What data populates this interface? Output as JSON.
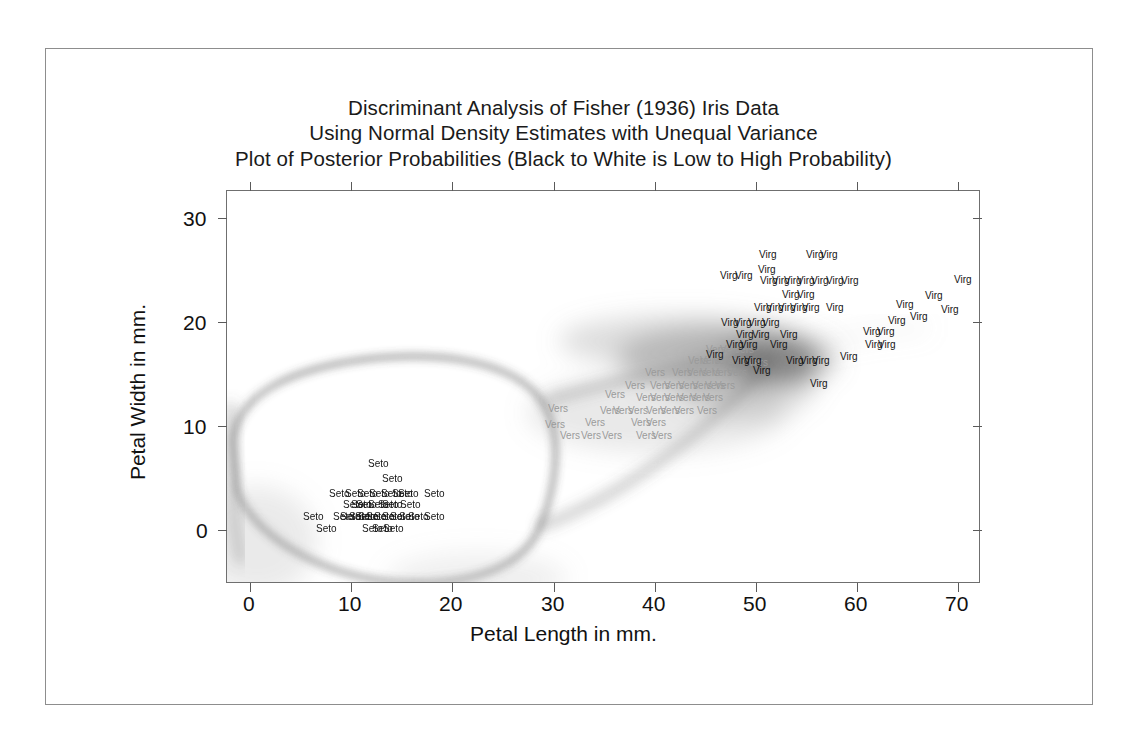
{
  "figure": {
    "title_lines": [
      "Discriminant Analysis of Fisher (1936) Iris Data",
      "Using Normal Density Estimates with Unequal Variance",
      "Plot of Posterior Probabilities (Black to White is Low to High Probability)"
    ],
    "background_color": "#ffffff",
    "frame_color": "#8d8d8d",
    "axis_color": "#6f6f6f"
  },
  "chart_data": {
    "type": "scatter",
    "xlabel": "Petal Length in mm.",
    "ylabel": "Petal Width in mm.",
    "xlim": [
      -4,
      74
    ],
    "ylim": [
      -5,
      33
    ],
    "xticks": [
      0,
      10,
      20,
      30,
      40,
      50,
      60,
      70
    ],
    "yticks": [
      0,
      10,
      20,
      30
    ],
    "xtick_labels": [
      "0",
      "10",
      "20",
      "30",
      "40",
      "50",
      "60",
      "70"
    ],
    "ytick_labels": [
      "0",
      "10",
      "20",
      "30"
    ],
    "grid": false,
    "legend": "none",
    "annotation": "Shaded background encodes posterior probability: black = low, white = high.",
    "group_labels": {
      "setosa": "Seto",
      "versicolor": "Vers",
      "virginica": "Virg"
    },
    "group_colors": {
      "setosa": "#141414",
      "versicolor": "#9a9a9a",
      "virginica": "#141414"
    },
    "series": [
      {
        "name": "Seto",
        "species": "Iris setosa",
        "color": "#141414",
        "points": [
          [
            14,
            2
          ],
          [
            15,
            1
          ],
          [
            13,
            2
          ],
          [
            15,
            2
          ],
          [
            14,
            2
          ],
          [
            17,
            4
          ],
          [
            14,
            3
          ],
          [
            15,
            2
          ],
          [
            14,
            2
          ],
          [
            15,
            1
          ],
          [
            15,
            2
          ],
          [
            16,
            2
          ],
          [
            14,
            1
          ],
          [
            11,
            1
          ],
          [
            12,
            2
          ],
          [
            15,
            4
          ],
          [
            13,
            4
          ],
          [
            14,
            3
          ],
          [
            17,
            3
          ],
          [
            15,
            3
          ],
          [
            17,
            2
          ],
          [
            15,
            4
          ],
          [
            10,
            2
          ],
          [
            17,
            5
          ],
          [
            19,
            2
          ],
          [
            16,
            2
          ],
          [
            16,
            4
          ],
          [
            15,
            2
          ],
          [
            14,
            2
          ],
          [
            16,
            2
          ],
          [
            16,
            2
          ],
          [
            15,
            4
          ],
          [
            15,
            1
          ],
          [
            14,
            2
          ],
          [
            15,
            2
          ],
          [
            12,
            2
          ],
          [
            13,
            2
          ],
          [
            15,
            1
          ],
          [
            13,
            2
          ],
          [
            15,
            2
          ],
          [
            13,
            3
          ],
          [
            13,
            3
          ],
          [
            13,
            2
          ],
          [
            16,
            6
          ],
          [
            19,
            4
          ],
          [
            14,
            3
          ],
          [
            16,
            2
          ],
          [
            14,
            2
          ],
          [
            15,
            2
          ],
          [
            14,
            2
          ]
        ]
      },
      {
        "name": "Vers",
        "species": "Iris versicolor",
        "color": "#9a9a9a",
        "points": [
          [
            47,
            14
          ],
          [
            45,
            15
          ],
          [
            49,
            15
          ],
          [
            40,
            13
          ],
          [
            46,
            15
          ],
          [
            45,
            13
          ],
          [
            47,
            16
          ],
          [
            33,
            10
          ],
          [
            46,
            13
          ],
          [
            39,
            14
          ],
          [
            35,
            10
          ],
          [
            42,
            15
          ],
          [
            40,
            10
          ],
          [
            47,
            14
          ],
          [
            36,
            13
          ],
          [
            44,
            14
          ],
          [
            45,
            15
          ],
          [
            41,
            10
          ],
          [
            45,
            15
          ],
          [
            39,
            11
          ],
          [
            48,
            18
          ],
          [
            40,
            13
          ],
          [
            49,
            15
          ],
          [
            47,
            12
          ],
          [
            43,
            13
          ],
          [
            44,
            14
          ],
          [
            48,
            14
          ],
          [
            50,
            17
          ],
          [
            45,
            15
          ],
          [
            35,
            10
          ],
          [
            38,
            11
          ],
          [
            37,
            10
          ],
          [
            39,
            12
          ],
          [
            51,
            16
          ],
          [
            45,
            15
          ],
          [
            45,
            16
          ],
          [
            47,
            15
          ],
          [
            44,
            13
          ],
          [
            41,
            13
          ],
          [
            40,
            13
          ],
          [
            44,
            12
          ],
          [
            46,
            14
          ],
          [
            40,
            12
          ],
          [
            33,
            10
          ],
          [
            42,
            13
          ],
          [
            42,
            12
          ],
          [
            42,
            13
          ],
          [
            43,
            13
          ],
          [
            30,
            11
          ],
          [
            41,
            13
          ]
        ]
      },
      {
        "name": "Virg",
        "species": "Iris virginica",
        "color": "#141414",
        "points": [
          [
            60,
            25
          ],
          [
            51,
            19
          ],
          [
            59,
            21
          ],
          [
            56,
            18
          ],
          [
            58,
            22
          ],
          [
            66,
            21
          ],
          [
            45,
            17
          ],
          [
            63,
            18
          ],
          [
            58,
            18
          ],
          [
            61,
            25
          ],
          [
            51,
            20
          ],
          [
            53,
            19
          ],
          [
            55,
            21
          ],
          [
            50,
            20
          ],
          [
            51,
            24
          ],
          [
            53,
            23
          ],
          [
            55,
            18
          ],
          [
            67,
            22
          ],
          [
            69,
            23
          ],
          [
            50,
            15
          ],
          [
            57,
            23
          ],
          [
            49,
            20
          ],
          [
            67,
            20
          ],
          [
            49,
            18
          ],
          [
            57,
            21
          ],
          [
            60,
            18
          ],
          [
            48,
            18
          ],
          [
            49,
            18
          ],
          [
            56,
            21
          ],
          [
            58,
            16
          ],
          [
            61,
            19
          ],
          [
            64,
            20
          ],
          [
            56,
            22
          ],
          [
            51,
            15
          ],
          [
            56,
            14
          ],
          [
            61,
            23
          ],
          [
            56,
            24
          ],
          [
            55,
            18
          ],
          [
            48,
            18
          ],
          [
            54,
            21
          ],
          [
            56,
            24
          ],
          [
            51,
            23
          ],
          [
            51,
            19
          ],
          [
            59,
            23
          ],
          [
            57,
            25
          ],
          [
            52,
            23
          ],
          [
            50,
            19
          ],
          [
            52,
            20
          ],
          [
            54,
            23
          ],
          [
            51,
            18
          ]
        ]
      }
    ]
  },
  "axes": {
    "x_title": "Petal Length in mm.",
    "y_title": "Petal Width in mm."
  },
  "labels": {
    "seto": [
      {
        "t": "Seto",
        "x": 368,
        "y": 459
      },
      {
        "t": "Seto",
        "x": 382,
        "y": 474
      },
      {
        "t": "Seto",
        "x": 329,
        "y": 489
      },
      {
        "t": "Seto",
        "x": 357,
        "y": 489
      },
      {
        "t": "Seto",
        "x": 369,
        "y": 489
      },
      {
        "t": "Seto",
        "x": 381,
        "y": 489
      },
      {
        "t": "Seto",
        "x": 398,
        "y": 489
      },
      {
        "t": "Seto",
        "x": 424,
        "y": 489
      },
      {
        "t": "Seto",
        "x": 343,
        "y": 500
      },
      {
        "t": "Seto",
        "x": 356,
        "y": 500
      },
      {
        "t": "Seto",
        "x": 368,
        "y": 500
      },
      {
        "t": "Seto",
        "x": 382,
        "y": 500
      },
      {
        "t": "Seto",
        "x": 400,
        "y": 500
      },
      {
        "t": "Seto",
        "x": 303,
        "y": 512
      },
      {
        "t": "Seto",
        "x": 333,
        "y": 512
      },
      {
        "t": "Seto",
        "x": 349,
        "y": 512
      },
      {
        "t": "Seto",
        "x": 358,
        "y": 512
      },
      {
        "t": "Seto",
        "x": 366,
        "y": 512
      },
      {
        "t": "Seto",
        "x": 374,
        "y": 512
      },
      {
        "t": "Seto",
        "x": 382,
        "y": 512
      },
      {
        "t": "Seto",
        "x": 390,
        "y": 512
      },
      {
        "t": "Seto",
        "x": 399,
        "y": 512
      },
      {
        "t": "Seto",
        "x": 424,
        "y": 512
      },
      {
        "t": "Seto",
        "x": 316,
        "y": 524
      },
      {
        "t": "Seto",
        "x": 362,
        "y": 524
      },
      {
        "t": "Seto",
        "x": 372,
        "y": 524
      },
      {
        "t": "Seto",
        "x": 383,
        "y": 524
      },
      {
        "t": "Seto",
        "x": 345,
        "y": 489
      },
      {
        "t": "Seto",
        "x": 351,
        "y": 500
      },
      {
        "t": "Seto",
        "x": 340,
        "y": 512
      },
      {
        "t": "Seto",
        "x": 355,
        "y": 512
      },
      {
        "t": "Seto",
        "x": 378,
        "y": 500
      },
      {
        "t": "Seto",
        "x": 392,
        "y": 489
      },
      {
        "t": "Seto",
        "x": 408,
        "y": 512
      }
    ],
    "vers": [
      {
        "t": "Vers",
        "x": 605,
        "y": 390
      },
      {
        "t": "Vers",
        "x": 548,
        "y": 404
      },
      {
        "t": "Vers",
        "x": 625,
        "y": 381
      },
      {
        "t": "Vers",
        "x": 650,
        "y": 381
      },
      {
        "t": "Vers",
        "x": 664,
        "y": 381
      },
      {
        "t": "Vers",
        "x": 678,
        "y": 381
      },
      {
        "t": "Vers",
        "x": 692,
        "y": 381
      },
      {
        "t": "Vers",
        "x": 705,
        "y": 381
      },
      {
        "t": "Vers",
        "x": 715,
        "y": 381
      },
      {
        "t": "Vers",
        "x": 645,
        "y": 368
      },
      {
        "t": "Vers",
        "x": 672,
        "y": 368
      },
      {
        "t": "Vers",
        "x": 687,
        "y": 368
      },
      {
        "t": "Vers",
        "x": 700,
        "y": 368
      },
      {
        "t": "Vers",
        "x": 712,
        "y": 368
      },
      {
        "t": "Vers",
        "x": 727,
        "y": 368
      },
      {
        "t": "Vers",
        "x": 688,
        "y": 356
      },
      {
        "t": "Vers",
        "x": 700,
        "y": 356
      },
      {
        "t": "Vers",
        "x": 713,
        "y": 356
      },
      {
        "t": "Vers",
        "x": 726,
        "y": 356
      },
      {
        "t": "Vers",
        "x": 739,
        "y": 356
      },
      {
        "t": "Vers",
        "x": 636,
        "y": 393
      },
      {
        "t": "Vers",
        "x": 650,
        "y": 393
      },
      {
        "t": "Vers",
        "x": 664,
        "y": 393
      },
      {
        "t": "Vers",
        "x": 677,
        "y": 393
      },
      {
        "t": "Vers",
        "x": 690,
        "y": 393
      },
      {
        "t": "Vers",
        "x": 703,
        "y": 393
      },
      {
        "t": "Vers",
        "x": 600,
        "y": 406
      },
      {
        "t": "Vers",
        "x": 613,
        "y": 406
      },
      {
        "t": "Vers",
        "x": 628,
        "y": 406
      },
      {
        "t": "Vers",
        "x": 646,
        "y": 406
      },
      {
        "t": "Vers",
        "x": 660,
        "y": 406
      },
      {
        "t": "Vers",
        "x": 674,
        "y": 406
      },
      {
        "t": "Vers",
        "x": 697,
        "y": 406
      },
      {
        "t": "Vers",
        "x": 585,
        "y": 418
      },
      {
        "t": "Vers",
        "x": 631,
        "y": 418
      },
      {
        "t": "Vers",
        "x": 646,
        "y": 418
      },
      {
        "t": "Vers",
        "x": 545,
        "y": 420
      },
      {
        "t": "Vers",
        "x": 560,
        "y": 431
      },
      {
        "t": "Vers",
        "x": 581,
        "y": 431
      },
      {
        "t": "Vers",
        "x": 602,
        "y": 431
      },
      {
        "t": "Vers",
        "x": 636,
        "y": 431
      },
      {
        "t": "Vers",
        "x": 652,
        "y": 431
      },
      {
        "t": "Vers",
        "x": 720,
        "y": 345
      },
      {
        "t": "Vers",
        "x": 734,
        "y": 345
      },
      {
        "t": "Vers",
        "x": 706,
        "y": 345
      },
      {
        "t": "Vers",
        "x": 748,
        "y": 358
      }
    ],
    "virg": [
      {
        "t": "Virg",
        "x": 759,
        "y": 250
      },
      {
        "t": "Virg",
        "x": 806,
        "y": 250
      },
      {
        "t": "Virg",
        "x": 820,
        "y": 250
      },
      {
        "t": "Virg",
        "x": 758,
        "y": 265
      },
      {
        "t": "Virg",
        "x": 760,
        "y": 276
      },
      {
        "t": "Virg",
        "x": 772,
        "y": 276
      },
      {
        "t": "Virg",
        "x": 784,
        "y": 276
      },
      {
        "t": "Virg",
        "x": 797,
        "y": 276
      },
      {
        "t": "Virg",
        "x": 811,
        "y": 276
      },
      {
        "t": "Virg",
        "x": 826,
        "y": 276
      },
      {
        "t": "Virg",
        "x": 841,
        "y": 276
      },
      {
        "t": "Virg",
        "x": 720,
        "y": 271
      },
      {
        "t": "Virg",
        "x": 735,
        "y": 271
      },
      {
        "t": "Virg",
        "x": 954,
        "y": 275
      },
      {
        "t": "Virg",
        "x": 782,
        "y": 290
      },
      {
        "t": "Virg",
        "x": 797,
        "y": 290
      },
      {
        "t": "Virg",
        "x": 925,
        "y": 291
      },
      {
        "t": "Virg",
        "x": 896,
        "y": 300
      },
      {
        "t": "Virg",
        "x": 910,
        "y": 312
      },
      {
        "t": "Virg",
        "x": 941,
        "y": 305
      },
      {
        "t": "Virg",
        "x": 754,
        "y": 303
      },
      {
        "t": "Virg",
        "x": 766,
        "y": 303
      },
      {
        "t": "Virg",
        "x": 778,
        "y": 303
      },
      {
        "t": "Virg",
        "x": 790,
        "y": 303
      },
      {
        "t": "Virg",
        "x": 802,
        "y": 303
      },
      {
        "t": "Virg",
        "x": 826,
        "y": 303
      },
      {
        "t": "Virg",
        "x": 721,
        "y": 318
      },
      {
        "t": "Virg",
        "x": 734,
        "y": 318
      },
      {
        "t": "Virg",
        "x": 748,
        "y": 318
      },
      {
        "t": "Virg",
        "x": 762,
        "y": 318
      },
      {
        "t": "Virg",
        "x": 736,
        "y": 330
      },
      {
        "t": "Virg",
        "x": 752,
        "y": 330
      },
      {
        "t": "Virg",
        "x": 780,
        "y": 330
      },
      {
        "t": "Virg",
        "x": 863,
        "y": 327
      },
      {
        "t": "Virg",
        "x": 877,
        "y": 327
      },
      {
        "t": "Virg",
        "x": 726,
        "y": 340
      },
      {
        "t": "Virg",
        "x": 740,
        "y": 340
      },
      {
        "t": "Virg",
        "x": 770,
        "y": 340
      },
      {
        "t": "Virg",
        "x": 865,
        "y": 340
      },
      {
        "t": "Virg",
        "x": 878,
        "y": 340
      },
      {
        "t": "Virg",
        "x": 888,
        "y": 316
      },
      {
        "t": "Virg",
        "x": 706,
        "y": 350
      },
      {
        "t": "Virg",
        "x": 786,
        "y": 356
      },
      {
        "t": "Virg",
        "x": 800,
        "y": 356
      },
      {
        "t": "Virg",
        "x": 812,
        "y": 356
      },
      {
        "t": "Virg",
        "x": 840,
        "y": 352
      },
      {
        "t": "Virg",
        "x": 753,
        "y": 366
      },
      {
        "t": "Virg",
        "x": 810,
        "y": 379
      },
      {
        "t": "Virg",
        "x": 744,
        "y": 356
      },
      {
        "t": "Virg",
        "x": 732,
        "y": 356
      }
    ]
  }
}
